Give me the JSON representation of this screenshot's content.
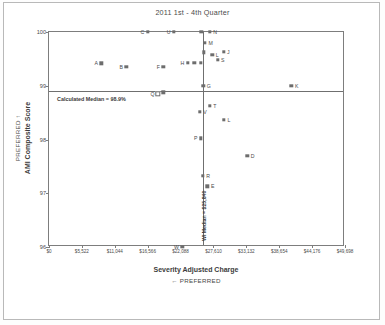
{
  "chart_data": {
    "type": "scatter",
    "title": "2011 1st - 4th Quarter",
    "xlabel": "Severity Adjusted Charge",
    "ylabel": "AMI Composite Score",
    "x_preferred_note": "PREFERRED",
    "x_preferred_arrow": "←",
    "y_preferred_note": "PREFERRED",
    "y_preferred_arrow": "↑",
    "xlim": [
      0,
      49698
    ],
    "ylim": [
      96,
      100
    ],
    "grid": false,
    "legend": "none",
    "xticks": [
      0,
      5522,
      11044,
      16566,
      22088,
      27610,
      33132,
      38654,
      44176,
      49698
    ],
    "xtick_labels": [
      "$0",
      "$5,522",
      "$11,044",
      "$16,566",
      "$22,088",
      "$27,610",
      "$33,132",
      "$38,654",
      "$44,176",
      "$49,698"
    ],
    "yticks": [
      96,
      97,
      98,
      99,
      100
    ],
    "ytick_labels": [
      "96",
      "97",
      "98",
      "99",
      "100"
    ],
    "reference_lines": [
      {
        "name": "calculated-median-horizontal",
        "orientation": "horizontal",
        "value": 98.9,
        "label": "Calculated Median = 98.9%"
      },
      {
        "name": "wi-median-vertical",
        "orientation": "vertical",
        "value": 25840,
        "label": "WI Median = $25,840"
      }
    ],
    "points": [
      {
        "label": "A",
        "x": 8800,
        "y": 99.42,
        "label_side": "left"
      },
      {
        "label": "B",
        "x": 13000,
        "y": 99.35,
        "label_side": "left"
      },
      {
        "label": "F",
        "x": 19200,
        "y": 99.35,
        "label_side": "left"
      },
      {
        "label": "H",
        "x": 23300,
        "y": 99.43,
        "label_side": "left"
      },
      {
        "label": "",
        "x": 24400,
        "y": 99.43,
        "label_side": "none"
      },
      {
        "label": "",
        "x": 25500,
        "y": 99.43,
        "label_side": "none"
      },
      {
        "label": "C",
        "x": 16600,
        "y": 100.0,
        "label_side": "left"
      },
      {
        "label": "U",
        "x": 21000,
        "y": 100.0,
        "label_side": "left"
      },
      {
        "label": "",
        "x": 25600,
        "y": 100.0,
        "label_side": "none"
      },
      {
        "label": "N",
        "x": 27000,
        "y": 100.0,
        "label_side": "right"
      },
      {
        "label": "M",
        "x": 26200,
        "y": 99.8,
        "label_side": "right"
      },
      {
        "label": "",
        "x": 26000,
        "y": 99.62,
        "label_side": "none"
      },
      {
        "label": "L",
        "x": 27400,
        "y": 99.58,
        "label_side": "right"
      },
      {
        "label": "J",
        "x": 29300,
        "y": 99.63,
        "label_side": "right"
      },
      {
        "label": "S",
        "x": 28300,
        "y": 99.48,
        "label_side": "right"
      },
      {
        "label": "G",
        "x": 25900,
        "y": 99.0,
        "label_side": "right"
      },
      {
        "label": "K",
        "x": 40700,
        "y": 99.0,
        "label_side": "right"
      },
      {
        "label": "Q",
        "x": 18300,
        "y": 98.85,
        "label_side": "left",
        "hollow": true
      },
      {
        "label": "",
        "x": 19200,
        "y": 98.88,
        "label_side": "none"
      },
      {
        "label": "T",
        "x": 27000,
        "y": 98.63,
        "label_side": "right"
      },
      {
        "label": "V",
        "x": 25300,
        "y": 98.52,
        "label_side": "right"
      },
      {
        "label": "L",
        "x": 29400,
        "y": 98.37,
        "label_side": "right"
      },
      {
        "label": "P",
        "x": 25500,
        "y": 98.02,
        "label_side": "left"
      },
      {
        "label": "D",
        "x": 33300,
        "y": 97.7,
        "label_side": "right"
      },
      {
        "label": "R",
        "x": 25800,
        "y": 97.32,
        "label_side": "right"
      },
      {
        "label": "E",
        "x": 26600,
        "y": 97.13,
        "label_side": "right"
      },
      {
        "label": "W",
        "x": 22400,
        "y": 96.0,
        "label_side": "left"
      }
    ]
  }
}
